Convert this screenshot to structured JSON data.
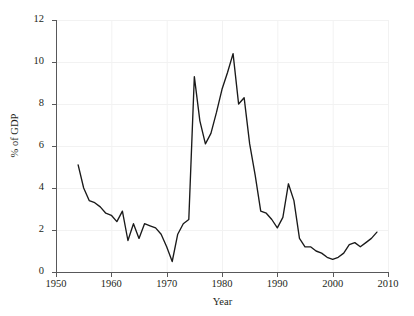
{
  "chart_data": {
    "type": "line",
    "title": "",
    "xlabel": "Year",
    "ylabel": "% of GDP",
    "xlim": [
      1950,
      2010
    ],
    "ylim": [
      0,
      12
    ],
    "grid": true,
    "legend": "none",
    "xticks": [
      1950,
      1960,
      1970,
      1980,
      1990,
      2000,
      2010
    ],
    "yticks": [
      0,
      2,
      4,
      6,
      8,
      10,
      12
    ],
    "series": [
      {
        "name": "% of GDP",
        "color": "#1a1a1a",
        "x": [
          1954,
          1955,
          1956,
          1957,
          1958,
          1959,
          1960,
          1961,
          1962,
          1963,
          1964,
          1965,
          1966,
          1967,
          1968,
          1969,
          1970,
          1971,
          1972,
          1973,
          1974,
          1975,
          1976,
          1977,
          1978,
          1979,
          1980,
          1981,
          1982,
          1983,
          1984,
          1985,
          1986,
          1987,
          1988,
          1989,
          1990,
          1991,
          1992,
          1993,
          1994,
          1995,
          1996,
          1997,
          1998,
          1999,
          2000,
          2001,
          2002,
          2003,
          2004,
          2005,
          2006,
          2007,
          2008
        ],
        "values": [
          5.1,
          4.0,
          3.4,
          3.3,
          3.1,
          2.8,
          2.7,
          2.4,
          2.9,
          1.5,
          2.3,
          1.6,
          2.3,
          2.2,
          2.1,
          1.8,
          1.2,
          0.5,
          1.8,
          2.3,
          2.5,
          9.3,
          7.2,
          6.1,
          6.6,
          7.6,
          8.7,
          9.5,
          10.4,
          8.0,
          8.3,
          6.1,
          4.6,
          2.9,
          2.8,
          2.5,
          2.1,
          2.6,
          4.2,
          3.4,
          1.6,
          1.2,
          1.2,
          1.0,
          0.9,
          0.7,
          0.6,
          0.7,
          0.9,
          1.3,
          1.4,
          1.2,
          1.4,
          1.6,
          1.9
        ]
      }
    ]
  },
  "axes": {
    "ylabel_text": "% of GDP",
    "xlabel_text": "Year"
  }
}
